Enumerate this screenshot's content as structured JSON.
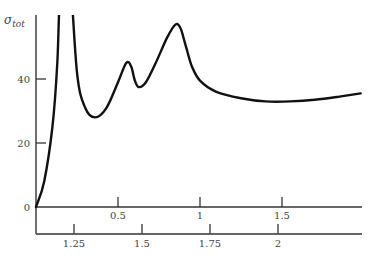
{
  "chart_data": {
    "type": "line",
    "title": "",
    "ylabel": "σ",
    "ylabel_subscript": "tot",
    "xlabel": "",
    "ylim": [
      0,
      60
    ],
    "y_ticks": [
      {
        "value": 0,
        "label": "0"
      },
      {
        "value": 20,
        "label": "20"
      },
      {
        "value": 40,
        "label": "40"
      }
    ],
    "x_axis_upper": {
      "ticks": [
        {
          "value": 0.5,
          "label": "0.5"
        },
        {
          "value": 1,
          "label": "1"
        },
        {
          "value": 1.5,
          "label": "1.5"
        }
      ],
      "range": [
        0,
        1.98
      ]
    },
    "x_axis_lower": {
      "ticks": [
        {
          "value": 1.25,
          "label": "1.25"
        },
        {
          "value": 1.5,
          "label": "1.5"
        },
        {
          "value": 1.75,
          "label": "1.75"
        },
        {
          "value": 2,
          "label": "2"
        }
      ]
    },
    "grid": false,
    "legend": null,
    "series": [
      {
        "name": "σ_tot",
        "x": [
          0.0,
          0.05,
          0.1,
          0.13,
          0.155,
          0.2,
          0.25,
          0.3,
          0.36,
          0.43,
          0.5,
          0.55,
          0.58,
          0.6,
          0.625,
          0.67,
          0.73,
          0.8,
          0.85,
          0.88,
          0.91,
          0.95,
          1.0,
          1.1,
          1.25,
          1.4,
          1.55,
          1.7,
          1.85,
          1.98
        ],
        "values": [
          0,
          8,
          25,
          45,
          62,
          62,
          42,
          31,
          28,
          31,
          39,
          45,
          44,
          40,
          37.5,
          39,
          45,
          53,
          57,
          56,
          51,
          44,
          39.5,
          36,
          34,
          33,
          33,
          33.5,
          34.5,
          35.5
        ]
      }
    ],
    "annotations": [
      "curve exceeds top of plot near x≈0.13–0.2"
    ]
  },
  "colors": {
    "curve": "#111111",
    "axis": "#333333",
    "text": "#444444"
  }
}
